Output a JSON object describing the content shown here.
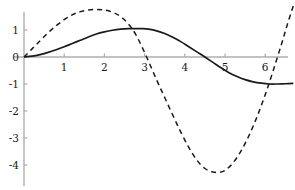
{
  "chart_data": {
    "type": "line",
    "title": "",
    "xlabel": "",
    "ylabel": "",
    "xlim": [
      -0.15,
      6.75
    ],
    "ylim": [
      -4.85,
      1.95
    ],
    "grid": false,
    "legend": null,
    "axis_color": "#aeaeae",
    "curve_color": "#1a1a1a",
    "x_ticks": [
      1,
      2,
      3,
      4,
      5,
      6
    ],
    "x_tick_labels": [
      "1",
      "2",
      "3",
      "4",
      "5",
      "6"
    ],
    "y_ticks": [
      1,
      0,
      -1,
      -2,
      -3,
      -4
    ],
    "y_tick_labels": [
      "1",
      "0",
      "-1",
      "-2",
      "-3",
      "-4"
    ],
    "series": [
      {
        "name": "solid-curve",
        "style": "solid",
        "color": "#1a1a1a",
        "x": [
          0.0,
          0.2,
          0.4,
          0.6,
          0.8,
          1.0,
          1.2,
          1.4,
          1.6,
          1.8,
          2.0,
          2.2,
          2.4,
          2.6,
          2.8,
          2.95,
          3.1,
          3.3,
          3.5,
          3.7,
          3.9,
          4.1,
          4.3,
          4.5,
          4.7,
          4.9,
          5.1,
          5.3,
          5.5,
          5.7,
          5.9,
          6.1,
          6.3,
          6.5,
          6.7
        ],
        "y": [
          0.0,
          0.03,
          0.09,
          0.17,
          0.27,
          0.38,
          0.5,
          0.62,
          0.74,
          0.85,
          0.93,
          0.99,
          1.03,
          1.05,
          1.05,
          1.05,
          1.03,
          0.97,
          0.87,
          0.73,
          0.57,
          0.38,
          0.19,
          0.0,
          -0.2,
          -0.4,
          -0.58,
          -0.72,
          -0.84,
          -0.92,
          -0.97,
          -1.0,
          -1.0,
          -0.99,
          -0.98
        ]
      },
      {
        "name": "dashed-curve",
        "style": "dashed",
        "color": "#1a1a1a",
        "dash": "5 4",
        "x": [
          0.0,
          0.2,
          0.4,
          0.6,
          0.8,
          1.0,
          1.2,
          1.4,
          1.6,
          1.8,
          2.0,
          2.2,
          2.4,
          2.6,
          2.8,
          3.05,
          3.3,
          3.5,
          3.7,
          3.9,
          4.1,
          4.3,
          4.5,
          4.7,
          4.85,
          5.0,
          5.2,
          5.4,
          5.6,
          5.8,
          6.0,
          6.2,
          6.4,
          6.55,
          6.7
        ],
        "y": [
          0.0,
          0.3,
          0.6,
          0.9,
          1.16,
          1.38,
          1.56,
          1.68,
          1.74,
          1.76,
          1.74,
          1.66,
          1.5,
          1.22,
          0.78,
          0.0,
          -0.85,
          -1.5,
          -2.15,
          -2.78,
          -3.35,
          -3.82,
          -4.13,
          -4.26,
          -4.27,
          -4.2,
          -3.92,
          -3.48,
          -2.9,
          -2.2,
          -1.4,
          -0.5,
          0.45,
          1.2,
          1.9
        ]
      }
    ]
  }
}
